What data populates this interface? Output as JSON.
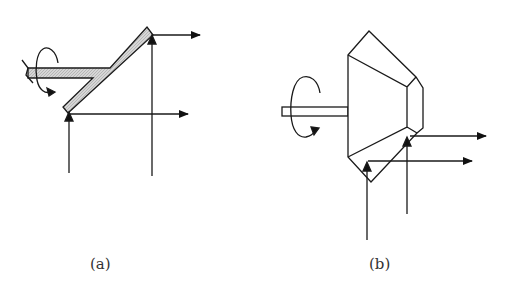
{
  "figure": {
    "panels": [
      {
        "id": "a",
        "label": "(a)",
        "description": "Y-shaped rotating mirror with rotation arrow and two parallel output arrows"
      },
      {
        "id": "b",
        "label": "(b)",
        "description": "Polygonal rotating mirror on a shaft with rotation arrow and two parallel output arrows"
      }
    ],
    "colors": {
      "stroke": "#1a1a1a",
      "fill": "#c8c8c8",
      "background": "#ffffff"
    }
  }
}
